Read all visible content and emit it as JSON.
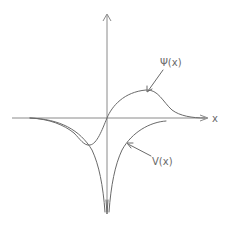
{
  "diagram": {
    "axes": {
      "x_label": "x",
      "y_label": ""
    },
    "curves": [
      {
        "name": "wavefunction",
        "label": "Ψ(x)",
        "description": "antisymmetric-like wave: dip on left, peak on right, decaying to zero at both ends"
      },
      {
        "name": "potential",
        "label": "V(x)",
        "description": "symmetric potential well diverging to -∞ at the origin"
      }
    ],
    "colors": {
      "ink": "#6a6a6a",
      "axis": "#8a8a8a",
      "background": "#ffffff"
    }
  }
}
